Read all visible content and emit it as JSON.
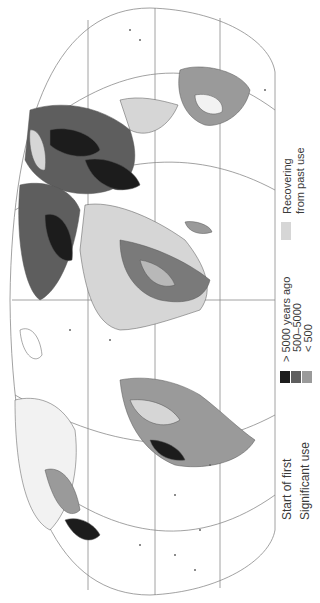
{
  "figure": {
    "type": "world-map",
    "orientation": "rotated 90 degrees counter-clockwise",
    "projection": "pseudo-elliptical (Eckert-like)"
  },
  "legend": {
    "title_line1": "Start of first",
    "title_line2": "Significant use",
    "items": [
      {
        "label": "> 5000 years ago",
        "color": "#1c1c1c"
      },
      {
        "label": "500–5000",
        "color": "#5e5e5e"
      },
      {
        "label": "< 500",
        "color": "#9a9a9a"
      }
    ],
    "recovering": {
      "label_line1": "Recovering",
      "label_line2": "from past use",
      "color": "#d6d6d6"
    }
  },
  "colors": {
    "graticule": "#8a8a8a",
    "coastline": "#555555",
    "background": "#ffffff"
  }
}
